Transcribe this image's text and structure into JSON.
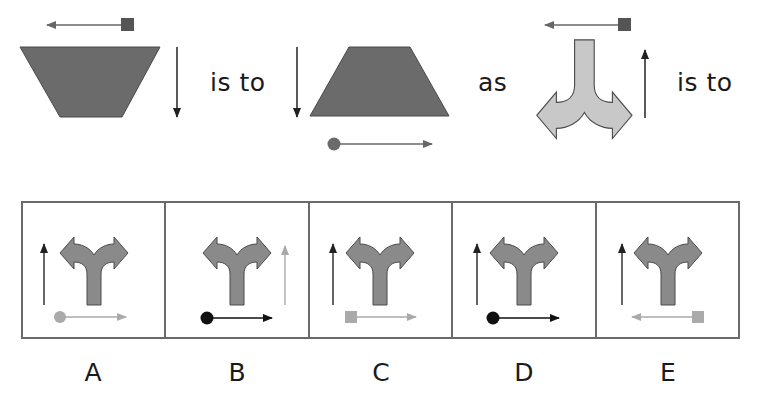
{
  "question": {
    "truncated_heading_fragment": "",
    "connectors": {
      "first": "is to",
      "second": "as",
      "third": "is to"
    },
    "terms": [
      {
        "shape": "inverted-trapezoid",
        "fill": "#6b6b6b",
        "horizontal_arrow": {
          "direction": "left",
          "marker": "square",
          "marker_color": "#555555"
        },
        "vertical_arrow": {
          "direction": "down",
          "side": "right"
        }
      },
      {
        "shape": "upright-trapezoid",
        "fill": "#6b6b6b",
        "horizontal_arrow": {
          "direction": "right",
          "marker": "circle",
          "marker_color": "#6b6b6b",
          "position": "below"
        },
        "vertical_arrow": {
          "direction": "down",
          "side": "left"
        }
      },
      {
        "shape": "fork-arrow-pointing-down",
        "fill": "#c8c8c8",
        "horizontal_arrow": {
          "direction": "left",
          "marker": "square",
          "marker_color": "#555555",
          "position": "above"
        },
        "vertical_arrow": {
          "direction": "up",
          "side": "right"
        }
      }
    ]
  },
  "options": [
    {
      "label": "A",
      "fork_fill": "#8a8a8a",
      "vertical_arrow": {
        "side": "left",
        "color": "#333333"
      },
      "horizontal_arrow": {
        "direction": "right",
        "marker": "circle",
        "color": "#aaaaaa"
      }
    },
    {
      "label": "B",
      "fork_fill": "#8a8a8a",
      "vertical_arrow": {
        "side": "right",
        "color": "#b0b0b0"
      },
      "horizontal_arrow": {
        "direction": "right",
        "marker": "circle",
        "color": "#111111"
      }
    },
    {
      "label": "C",
      "fork_fill": "#8a8a8a",
      "vertical_arrow": {
        "side": "left",
        "color": "#333333"
      },
      "horizontal_arrow": {
        "direction": "right",
        "marker": "square",
        "color": "#aaaaaa"
      }
    },
    {
      "label": "D",
      "fork_fill": "#8a8a8a",
      "vertical_arrow": {
        "side": "left",
        "color": "#333333"
      },
      "horizontal_arrow": {
        "direction": "right",
        "marker": "circle",
        "color": "#111111"
      }
    },
    {
      "label": "E",
      "fork_fill": "#8a8a8a",
      "vertical_arrow": {
        "side": "left",
        "color": "#333333"
      },
      "horizontal_arrow": {
        "direction": "left",
        "marker": "square",
        "color": "#aaaaaa"
      }
    }
  ],
  "colors": {
    "dark_shape": "#6b6b6b",
    "light_shape": "#c8c8c8",
    "option_shape": "#8a8a8a",
    "outline": "#4a4a4a",
    "box_border": "#6a6a6a"
  }
}
